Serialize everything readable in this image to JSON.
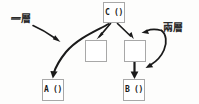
{
  "diagram": {
    "type": "call-nesting-diagram",
    "stroke_color": "#1a1a1a",
    "box_border_color": "#a8a8a8",
    "box_fill_color": "#ffffff",
    "background_color": "#fdfdfc",
    "nodes": [
      {
        "id": "c",
        "label": "C ()",
        "role": "caller-top",
        "x": 103,
        "y": 2,
        "w": 22,
        "h": 21
      },
      {
        "id": "m1",
        "label": "",
        "role": "inner-block-left",
        "x": 85,
        "y": 40,
        "w": 22,
        "h": 22
      },
      {
        "id": "m2",
        "label": "",
        "role": "inner-block-right",
        "x": 124,
        "y": 40,
        "w": 22,
        "h": 22
      },
      {
        "id": "a",
        "label": "A ()",
        "role": "callee-left",
        "x": 42,
        "y": 79,
        "w": 22,
        "h": 22
      },
      {
        "id": "b",
        "label": "B ()",
        "role": "callee-right",
        "x": 123,
        "y": 79,
        "w": 22,
        "h": 22
      }
    ],
    "annotations": [
      {
        "id": "one-layer",
        "text": "一層",
        "meaning": "one layer",
        "x": 11,
        "y": 14
      },
      {
        "id": "two-layer",
        "text": "兩層",
        "meaning": "two layers",
        "x": 163,
        "y": 23
      }
    ],
    "edges": [
      {
        "from": "c",
        "to": "m1",
        "style": "straight-arrow"
      },
      {
        "from": "c",
        "to": "m2",
        "style": "straight-arrow"
      },
      {
        "from": "c",
        "to": "a",
        "style": "long-curved-arrow"
      },
      {
        "from": "m2",
        "to": "b",
        "style": "straight-arrow-down"
      },
      {
        "from": "one-layer",
        "to": "c-a-edge",
        "style": "curved-pointer"
      },
      {
        "from": "two-layer",
        "to": "m2-and-b",
        "style": "double-headed-curve"
      }
    ]
  }
}
